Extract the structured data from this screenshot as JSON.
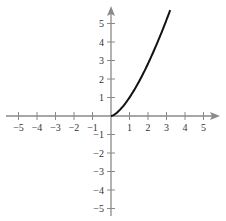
{
  "chart_data": {
    "type": "line",
    "title": "",
    "xlabel": "",
    "ylabel": "",
    "xlim": [
      -5.8,
      5.8
    ],
    "ylim": [
      -5.6,
      5.9
    ],
    "grid": false,
    "legend": null,
    "x_ticks": [
      -5,
      -4,
      -3,
      -2,
      -1,
      1,
      2,
      3,
      4,
      5
    ],
    "x_tick_labels": [
      "−5",
      "−4",
      "−3",
      "−2",
      "−1",
      "1",
      "2",
      "3",
      "4",
      "5"
    ],
    "y_ticks": [
      5,
      4,
      3,
      2,
      1,
      -1,
      -2,
      -3,
      -4,
      -5
    ],
    "y_tick_labels": [
      "5",
      "4",
      "3",
      "2",
      "1",
      "−1",
      "−2",
      "−3",
      "−4",
      "−5"
    ],
    "series": [
      {
        "name": "curve",
        "description": "increasing curve starting at origin, approximately y = x^(3/2)",
        "x": [
          0,
          0.5,
          1,
          1.5,
          2,
          2.5,
          3,
          3.2
        ],
        "y": [
          0,
          0.35,
          1.0,
          1.84,
          2.83,
          3.95,
          5.2,
          5.72
        ]
      }
    ],
    "colors": {
      "axis": "#8a8a8a",
      "curve": "#111111",
      "labels": "#333333"
    }
  }
}
